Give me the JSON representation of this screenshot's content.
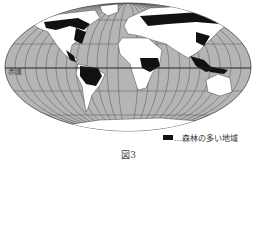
{
  "figure": {
    "caption": "図3",
    "equator_label": "赤道",
    "legend": {
      "swatch_color": "#111111",
      "label": "…森林の多い地域"
    },
    "colors": {
      "ocean": "#b5b5b5",
      "land": "#ffffff",
      "forest": "#111111",
      "grid": "#555555"
    }
  }
}
